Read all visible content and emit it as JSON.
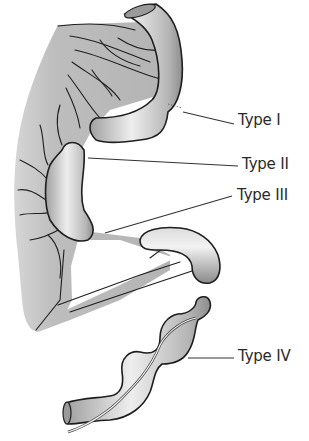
{
  "figure": {
    "colors": {
      "mesentery": "#b8b8b8",
      "bowel_light": "#f2f2f2",
      "bowel_dark": "#8a8a8a",
      "outline": "#1e1e1e",
      "leader_line": "#333333",
      "label_text": "#2a2a2a"
    }
  },
  "labels": [
    {
      "id": "type-1",
      "text": "Type I"
    },
    {
      "id": "type-2",
      "text": "Type II"
    },
    {
      "id": "type-3",
      "text": "Type III"
    },
    {
      "id": "type-4",
      "text": "Type IV"
    }
  ]
}
